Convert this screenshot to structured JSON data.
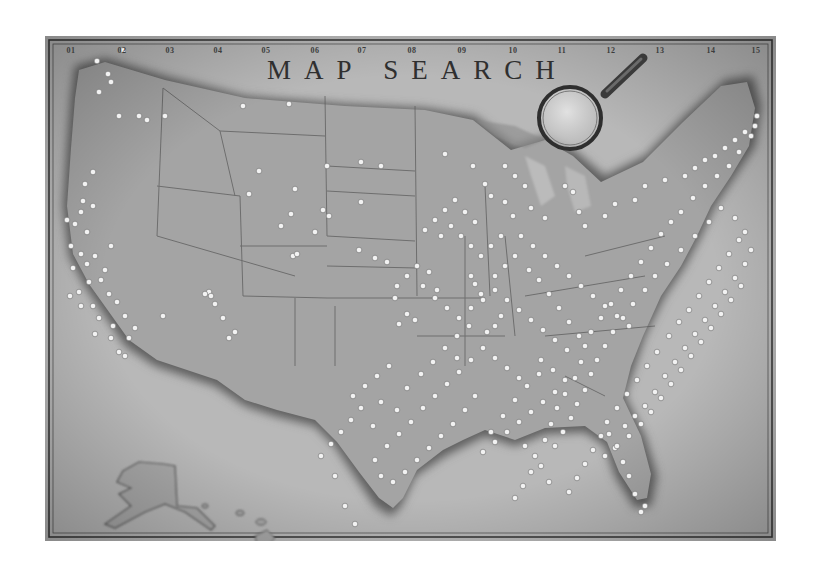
{
  "map": {
    "title": "MAP SEARCH",
    "column_labels": [
      "01",
      "02",
      "03",
      "04",
      "05",
      "06",
      "07",
      "08",
      "09",
      "10",
      "11",
      "12",
      "13",
      "14",
      "15"
    ],
    "column_label_x": [
      26,
      77,
      125,
      173,
      221,
      270,
      317,
      367,
      417,
      468,
      517,
      566,
      615,
      666,
      711
    ],
    "colors": {
      "paper": "#b4b4b4",
      "land": "#a2a2a2",
      "coast_shadow": "#6e6e6e",
      "border_line": "#5a5a5a",
      "pin": "#f2f2f2",
      "frame_line": "#3a3a3a"
    },
    "magnifier": {
      "cx": 525,
      "cy": 82,
      "r": 31,
      "handle": [
        560,
        58,
        598,
        22
      ]
    },
    "regions": [
      "Contiguous United States",
      "Alaska",
      "Hawaii"
    ],
    "pins": [
      [
        52,
        25
      ],
      [
        78,
        14
      ],
      [
        63,
        38
      ],
      [
        66,
        46
      ],
      [
        54,
        56
      ],
      [
        74,
        80
      ],
      [
        94,
        80
      ],
      [
        102,
        84
      ],
      [
        120,
        80
      ],
      [
        198,
        70
      ],
      [
        244,
        68
      ],
      [
        40,
        148
      ],
      [
        48,
        136
      ],
      [
        22,
        184
      ],
      [
        30,
        188
      ],
      [
        36,
        176
      ],
      [
        38,
        165
      ],
      [
        48,
        170
      ],
      [
        42,
        196
      ],
      [
        26,
        210
      ],
      [
        36,
        218
      ],
      [
        28,
        232
      ],
      [
        42,
        228
      ],
      [
        50,
        220
      ],
      [
        60,
        234
      ],
      [
        44,
        246
      ],
      [
        34,
        256
      ],
      [
        56,
        244
      ],
      [
        66,
        210
      ],
      [
        25,
        260
      ],
      [
        64,
        258
      ],
      [
        72,
        266
      ],
      [
        80,
        280
      ],
      [
        90,
        292
      ],
      [
        84,
        302
      ],
      [
        74,
        316
      ],
      [
        68,
        290
      ],
      [
        54,
        282
      ],
      [
        48,
        270
      ],
      [
        36,
        270
      ],
      [
        50,
        298
      ],
      [
        66,
        302
      ],
      [
        80,
        320
      ],
      [
        118,
        280
      ],
      [
        164,
        256
      ],
      [
        166,
        260
      ],
      [
        214,
        135
      ],
      [
        204,
        158
      ],
      [
        250,
        153
      ],
      [
        246,
        178
      ],
      [
        236,
        190
      ],
      [
        248,
        220
      ],
      [
        252,
        218
      ],
      [
        170,
        268
      ],
      [
        160,
        258
      ],
      [
        178,
        282
      ],
      [
        190,
        296
      ],
      [
        184,
        302
      ],
      [
        278,
        174
      ],
      [
        284,
        180
      ],
      [
        314,
        214
      ],
      [
        316,
        166
      ],
      [
        282,
        130
      ],
      [
        316,
        126
      ],
      [
        336,
        130
      ],
      [
        270,
        196
      ],
      [
        330,
        222
      ],
      [
        342,
        226
      ],
      [
        352,
        250
      ],
      [
        350,
        262
      ],
      [
        362,
        278
      ],
      [
        354,
        288
      ],
      [
        370,
        284
      ],
      [
        384,
        236
      ],
      [
        392,
        254
      ],
      [
        412,
        300
      ],
      [
        426,
        240
      ],
      [
        424,
        290
      ],
      [
        430,
        248
      ],
      [
        436,
        258
      ],
      [
        442,
        296
      ],
      [
        450,
        290
      ],
      [
        456,
        280
      ],
      [
        400,
        118
      ],
      [
        428,
        130
      ],
      [
        440,
        148
      ],
      [
        446,
        160
      ],
      [
        460,
        166
      ],
      [
        468,
        180
      ],
      [
        486,
        172
      ],
      [
        500,
        182
      ],
      [
        520,
        150
      ],
      [
        528,
        156
      ],
      [
        534,
        176
      ],
      [
        540,
        190
      ],
      [
        560,
        180
      ],
      [
        570,
        168
      ],
      [
        590,
        164
      ],
      [
        600,
        150
      ],
      [
        620,
        144
      ],
      [
        640,
        140
      ],
      [
        650,
        132
      ],
      [
        660,
        124
      ],
      [
        670,
        120
      ],
      [
        680,
        112
      ],
      [
        690,
        104
      ],
      [
        700,
        96
      ],
      [
        710,
        90
      ],
      [
        712,
        80
      ],
      [
        706,
        100
      ],
      [
        694,
        116
      ],
      [
        684,
        130
      ],
      [
        672,
        140
      ],
      [
        660,
        150
      ],
      [
        648,
        162
      ],
      [
        636,
        176
      ],
      [
        626,
        186
      ],
      [
        616,
        198
      ],
      [
        606,
        212
      ],
      [
        596,
        226
      ],
      [
        586,
        240
      ],
      [
        576,
        254
      ],
      [
        566,
        268
      ],
      [
        556,
        282
      ],
      [
        546,
        296
      ],
      [
        540,
        310
      ],
      [
        536,
        326
      ],
      [
        530,
        342
      ],
      [
        520,
        358
      ],
      [
        512,
        372
      ],
      [
        506,
        388
      ],
      [
        500,
        404
      ],
      [
        490,
        420
      ],
      [
        486,
        436
      ],
      [
        478,
        450
      ],
      [
        470,
        462
      ],
      [
        480,
        410
      ],
      [
        496,
        430
      ],
      [
        504,
        446
      ],
      [
        600,
        470
      ],
      [
        596,
        476
      ],
      [
        590,
        458
      ],
      [
        584,
        440
      ],
      [
        578,
        426
      ],
      [
        570,
        412
      ],
      [
        564,
        398
      ],
      [
        580,
        390
      ],
      [
        590,
        380
      ],
      [
        600,
        370
      ],
      [
        610,
        356
      ],
      [
        620,
        340
      ],
      [
        630,
        326
      ],
      [
        640,
        312
      ],
      [
        650,
        298
      ],
      [
        660,
        284
      ],
      [
        670,
        270
      ],
      [
        680,
        256
      ],
      [
        690,
        242
      ],
      [
        700,
        228
      ],
      [
        706,
        214
      ],
      [
        700,
        196
      ],
      [
        690,
        182
      ],
      [
        676,
        172
      ],
      [
        664,
        186
      ],
      [
        650,
        200
      ],
      [
        636,
        214
      ],
      [
        622,
        228
      ],
      [
        610,
        240
      ],
      [
        600,
        254
      ],
      [
        588,
        268
      ],
      [
        578,
        282
      ],
      [
        568,
        296
      ],
      [
        560,
        310
      ],
      [
        552,
        324
      ],
      [
        546,
        338
      ],
      [
        540,
        354
      ],
      [
        532,
        368
      ],
      [
        526,
        382
      ],
      [
        518,
        396
      ],
      [
        510,
        410
      ],
      [
        624,
        300
      ],
      [
        634,
        286
      ],
      [
        644,
        274
      ],
      [
        654,
        260
      ],
      [
        664,
        246
      ],
      [
        674,
        232
      ],
      [
        684,
        218
      ],
      [
        694,
        204
      ],
      [
        612,
        316
      ],
      [
        602,
        330
      ],
      [
        592,
        344
      ],
      [
        582,
        358
      ],
      [
        572,
        372
      ],
      [
        562,
        386
      ],
      [
        556,
        400
      ],
      [
        548,
        414
      ],
      [
        540,
        428
      ],
      [
        532,
        442
      ],
      [
        524,
        456
      ],
      [
        560,
        420
      ],
      [
        572,
        410
      ],
      [
        584,
        400
      ],
      [
        596,
        388
      ],
      [
        606,
        376
      ],
      [
        616,
        362
      ],
      [
        626,
        348
      ],
      [
        636,
        334
      ],
      [
        646,
        320
      ],
      [
        656,
        306
      ],
      [
        666,
        292
      ],
      [
        676,
        278
      ],
      [
        686,
        264
      ],
      [
        696,
        250
      ],
      [
        480,
        150
      ],
      [
        470,
        140
      ],
      [
        460,
        130
      ],
      [
        476,
        200
      ],
      [
        488,
        210
      ],
      [
        500,
        220
      ],
      [
        512,
        230
      ],
      [
        524,
        240
      ],
      [
        536,
        250
      ],
      [
        548,
        260
      ],
      [
        560,
        270
      ],
      [
        572,
        280
      ],
      [
        584,
        290
      ],
      [
        470,
        220
      ],
      [
        460,
        230
      ],
      [
        450,
        240
      ],
      [
        456,
        200
      ],
      [
        446,
        210
      ],
      [
        436,
        220
      ],
      [
        426,
        210
      ],
      [
        416,
        200
      ],
      [
        406,
        190
      ],
      [
        396,
        200
      ],
      [
        420,
        176
      ],
      [
        430,
        186
      ],
      [
        410,
        164
      ],
      [
        400,
        174
      ],
      [
        390,
        184
      ],
      [
        380,
        194
      ],
      [
        372,
        230
      ],
      [
        362,
        240
      ],
      [
        378,
        250
      ],
      [
        390,
        262
      ],
      [
        402,
        272
      ],
      [
        414,
        282
      ],
      [
        426,
        272
      ],
      [
        438,
        264
      ],
      [
        450,
        254
      ],
      [
        462,
        264
      ],
      [
        474,
        274
      ],
      [
        486,
        284
      ],
      [
        498,
        294
      ],
      [
        510,
        304
      ],
      [
        522,
        314
      ],
      [
        534,
        300
      ],
      [
        524,
        286
      ],
      [
        514,
        272
      ],
      [
        504,
        258
      ],
      [
        494,
        244
      ],
      [
        484,
        234
      ],
      [
        496,
        324
      ],
      [
        508,
        334
      ],
      [
        520,
        344
      ],
      [
        510,
        356
      ],
      [
        498,
        366
      ],
      [
        486,
        376
      ],
      [
        474,
        386
      ],
      [
        462,
        396
      ],
      [
        450,
        406
      ],
      [
        438,
        416
      ],
      [
        446,
        396
      ],
      [
        458,
        380
      ],
      [
        470,
        364
      ],
      [
        482,
        350
      ],
      [
        494,
        338
      ],
      [
        430,
        360
      ],
      [
        420,
        374
      ],
      [
        408,
        388
      ],
      [
        396,
        400
      ],
      [
        384,
        412
      ],
      [
        372,
        424
      ],
      [
        360,
        436
      ],
      [
        348,
        446
      ],
      [
        336,
        440
      ],
      [
        330,
        424
      ],
      [
        342,
        410
      ],
      [
        354,
        398
      ],
      [
        366,
        386
      ],
      [
        378,
        372
      ],
      [
        390,
        360
      ],
      [
        402,
        348
      ],
      [
        414,
        336
      ],
      [
        426,
        324
      ],
      [
        438,
        312
      ],
      [
        450,
        322
      ],
      [
        462,
        332
      ],
      [
        474,
        342
      ],
      [
        344,
        330
      ],
      [
        332,
        340
      ],
      [
        320,
        350
      ],
      [
        308,
        360
      ],
      [
        316,
        372
      ],
      [
        306,
        384
      ],
      [
        296,
        396
      ],
      [
        286,
        408
      ],
      [
        276,
        420
      ],
      [
        290,
        440
      ],
      [
        300,
        470
      ],
      [
        310,
        488
      ],
      [
        336,
        366
      ],
      [
        352,
        374
      ],
      [
        328,
        390
      ],
      [
        362,
        352
      ],
      [
        376,
        338
      ],
      [
        388,
        326
      ],
      [
        400,
        312
      ],
      [
        412,
        322
      ]
    ],
    "state_lines": [
      "M118,52 L112,200",
      "M112,150 L195,160",
      "M195,160 L198,260",
      "M118,52 L175,95 L190,160",
      "M175,95 L280,100",
      "M280,60 L282,200",
      "M282,130 L370,135",
      "M282,200 L370,205",
      "M282,155 L370,160",
      "M370,70 L372,260",
      "M195,210 L282,210",
      "M198,260 L282,262",
      "M282,262 L372,262",
      "M282,230 L372,232",
      "M250,262 L250,330",
      "M290,270 L290,330",
      "M372,262 L440,262",
      "M372,300 L460,300",
      "M420,200 L420,330",
      "M440,150 L445,260",
      "M460,200 L470,300",
      "M480,260 L600,240",
      "M500,300 L610,290",
      "M520,340 L560,360",
      "M540,220 L620,200",
      "M112,200 L250,240"
    ]
  }
}
